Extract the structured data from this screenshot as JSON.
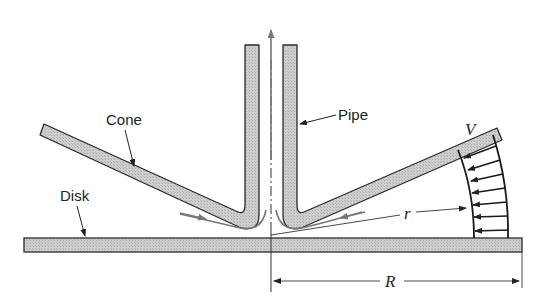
{
  "diagram": {
    "labels": {
      "cone": "Cone",
      "pipe": "Pipe",
      "disk": "Disk",
      "velocity": "V",
      "radius_local": "r",
      "radius_outer": "R"
    },
    "colors": {
      "solid_fill": "#c8c8c8",
      "outline": "#2a2a2a",
      "flow_arrow": "#777777",
      "background": "#ffffff"
    },
    "components": [
      "pipe",
      "cone",
      "disk",
      "centerline",
      "flow-streamlines",
      "velocity-profile",
      "radius-dimension-r",
      "radius-dimension-R"
    ]
  }
}
